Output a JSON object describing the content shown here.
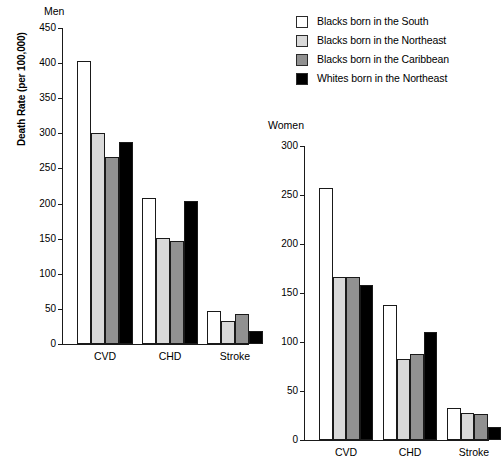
{
  "legend": {
    "items": [
      {
        "label": "Blacks born in the South",
        "color": "#ffffff",
        "key": "south"
      },
      {
        "label": "Blacks born in the Northeast",
        "color": "#d9d9d9",
        "key": "black_ne"
      },
      {
        "label": "Blacks born in the Caribbean",
        "color": "#919191",
        "key": "caribbean"
      },
      {
        "label": "Whites born in the Northeast",
        "color": "#000000",
        "key": "white_ne"
      }
    ]
  },
  "axis": {
    "ylabel": "Death Rate (per 100,000)"
  },
  "panels": {
    "men": {
      "title": "Men",
      "yticks": [
        "450",
        "400",
        "350",
        "300",
        "250",
        "200",
        "150",
        "100",
        "50",
        "0"
      ],
      "categories": [
        "CVD",
        "CHD",
        "Stroke"
      ]
    },
    "women": {
      "title": "Women",
      "yticks": [
        "300",
        "250",
        "200",
        "150",
        "100",
        "50",
        "0"
      ],
      "categories": [
        "CVD",
        "CHD",
        "Stroke"
      ]
    }
  },
  "chart_data": [
    {
      "type": "bar",
      "title": "Men",
      "xlabel": "",
      "ylabel": "Death Rate (per 100,000)",
      "ylim": [
        0,
        450
      ],
      "yticks": [
        0,
        50,
        100,
        150,
        200,
        250,
        300,
        350,
        400,
        450
      ],
      "grid": false,
      "legend_position": "top-right (shared)",
      "categories": [
        "CVD",
        "CHD",
        "Stroke"
      ],
      "series": [
        {
          "name": "Blacks born in the South",
          "color": "#ffffff",
          "values": [
            403,
            208,
            47
          ]
        },
        {
          "name": "Blacks born in the Northeast",
          "color": "#d9d9d9",
          "values": [
            300,
            151,
            33
          ]
        },
        {
          "name": "Blacks born in the Caribbean",
          "color": "#919191",
          "values": [
            266,
            146,
            43
          ]
        },
        {
          "name": "Whites born in the Northeast",
          "color": "#000000",
          "values": [
            287,
            204,
            18
          ]
        }
      ]
    },
    {
      "type": "bar",
      "title": "Women",
      "xlabel": "",
      "ylabel": "Death Rate (per 100,000)",
      "ylim": [
        0,
        300
      ],
      "yticks": [
        0,
        50,
        100,
        150,
        200,
        250,
        300
      ],
      "grid": false,
      "legend_position": "top-right (shared)",
      "categories": [
        "CVD",
        "CHD",
        "Stroke"
      ],
      "series": [
        {
          "name": "Blacks born in the South",
          "color": "#ffffff",
          "values": [
            257,
            138,
            33
          ]
        },
        {
          "name": "Blacks born in the Northeast",
          "color": "#d9d9d9",
          "values": [
            166,
            83,
            28
          ]
        },
        {
          "name": "Blacks born in the Caribbean",
          "color": "#919191",
          "values": [
            166,
            88,
            27
          ]
        },
        {
          "name": "Whites born in the Northeast",
          "color": "#000000",
          "values": [
            158,
            110,
            13
          ]
        }
      ]
    }
  ]
}
